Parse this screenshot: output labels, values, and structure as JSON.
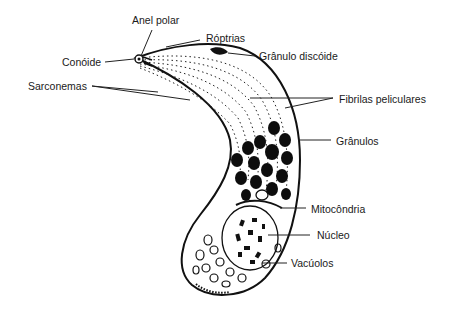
{
  "diagram": {
    "colors": {
      "ink": "#111111",
      "background": "#ffffff",
      "label": "#1a1a1a"
    },
    "labels": {
      "anel_polar": "Anel polar",
      "roptrias": "Róptrias",
      "conoide": "Conóide",
      "granulo_discoide": "Grânulo discóide",
      "sarconemas": "Sarconemas",
      "fibrilas_peliculares": "Fibrilas peliculares",
      "granulos": "Grânulos",
      "mitocondria": "Mitocôndria",
      "nucleo": "Núcleo",
      "vacuolos": "Vacúolos"
    }
  }
}
